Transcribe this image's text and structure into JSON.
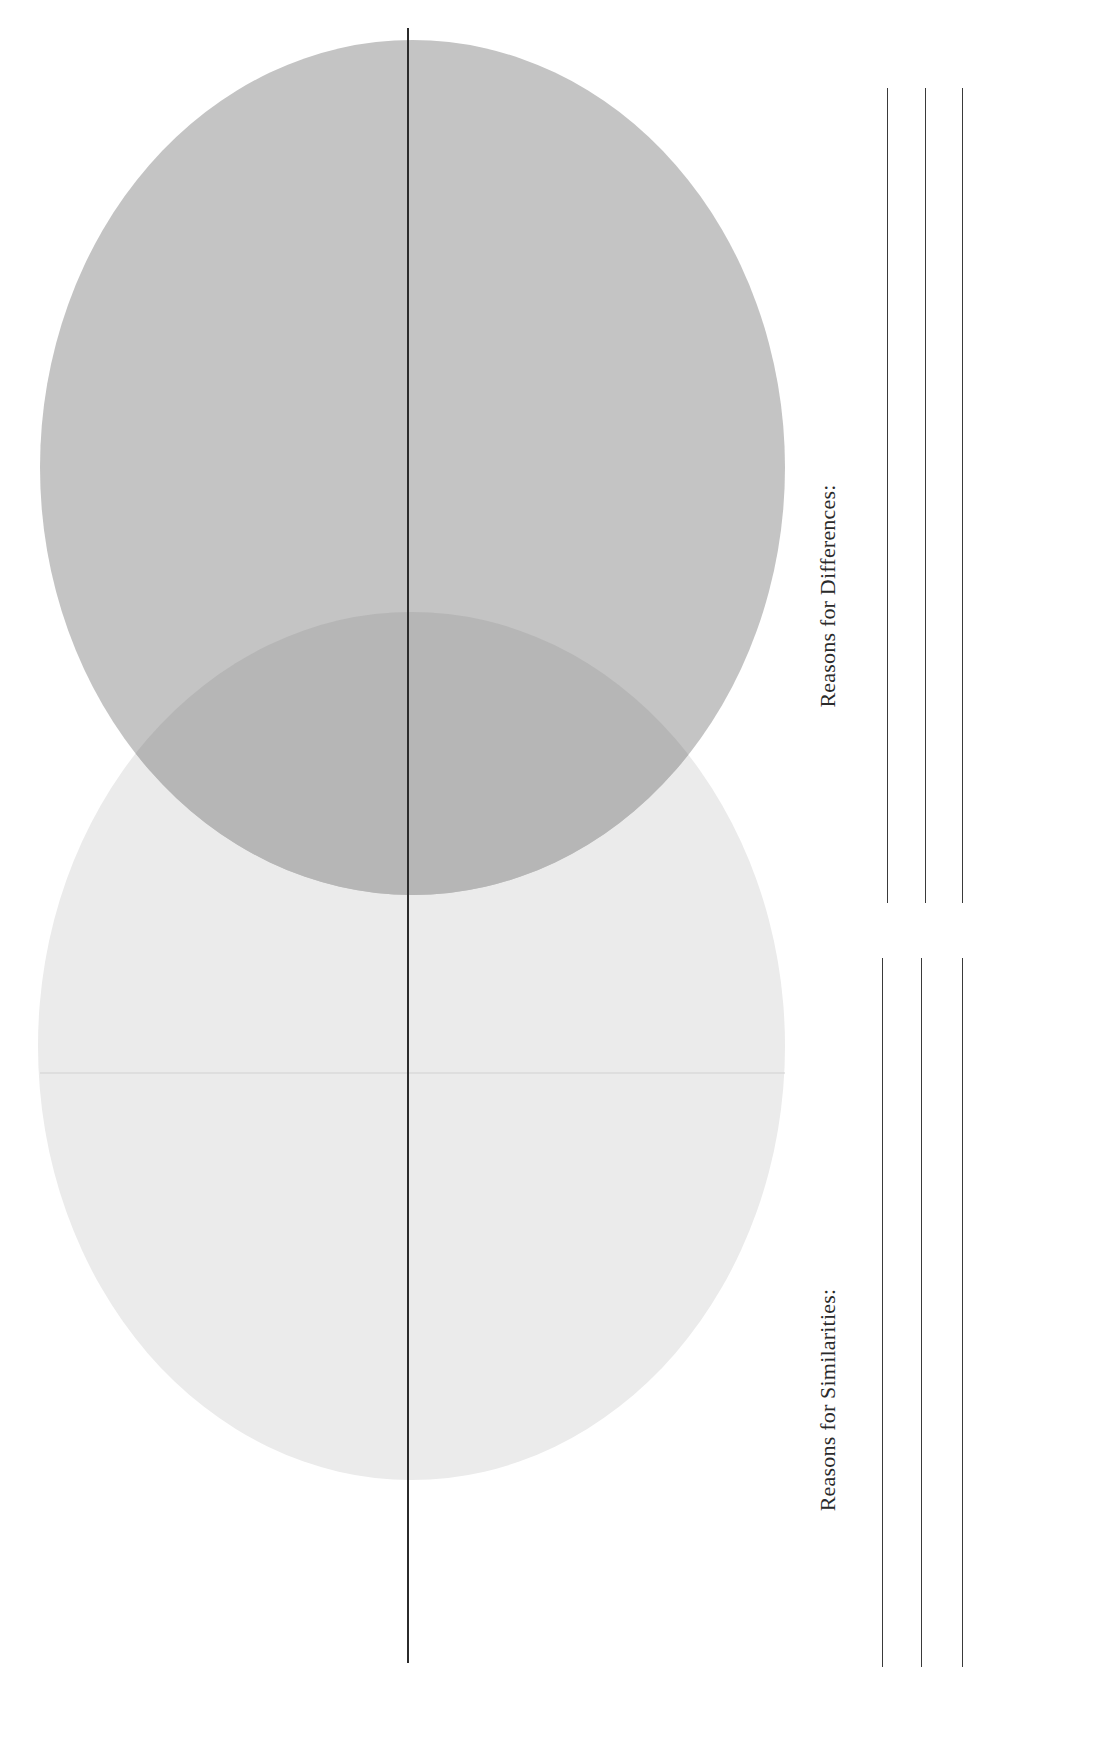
{
  "worksheet": {
    "type": "venn-diagram",
    "orientation": "rotated-90",
    "colors": {
      "top_circle": "#c4c4c4",
      "bottom_circle": "#ebebeb",
      "overlap": "#b6b6b6",
      "divider_line": "#2b2b2b",
      "faint_line": "#d4d4d4",
      "text": "#2a2a2a"
    }
  },
  "sections": {
    "differences": {
      "label": "Reasons for Differences:",
      "line_count": 3
    },
    "similarities": {
      "label": "Reasons for Similarities:",
      "line_count": 3
    }
  }
}
